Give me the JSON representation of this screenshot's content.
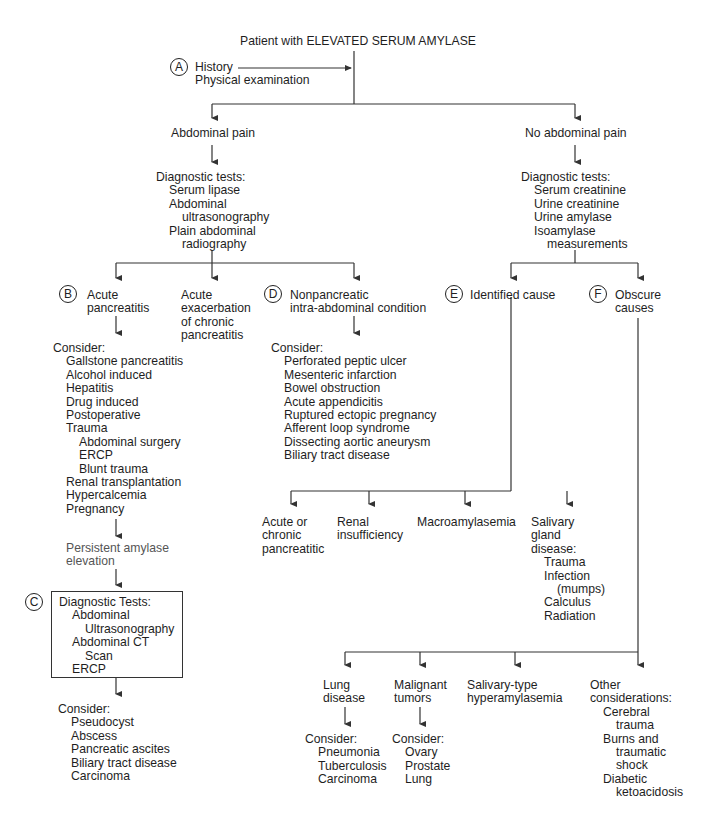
{
  "title": "Patient with ELEVATED SERUM AMYLASE",
  "step_a": {
    "badge": "A",
    "lines": [
      "History",
      "Physical examination"
    ]
  },
  "abdominal_pain": {
    "label": "Abdominal pain",
    "tests_header": "Diagnostic tests:",
    "tests": [
      "Serum lipase",
      "Abdominal",
      "ultrasonography",
      "Plain abdominal",
      "radiography"
    ]
  },
  "no_abdominal_pain": {
    "label": "No abdominal pain",
    "tests_header": "Diagnostic tests:",
    "tests": [
      "Serum creatinine",
      "Urine creatinine",
      "Urine amylase",
      "Isoamylase",
      "measurements"
    ]
  },
  "acute_pancreatitis": {
    "badge": "B",
    "label_lines": [
      "Acute",
      "pancreatitis"
    ],
    "consider_header": "Consider:",
    "consider": [
      "Gallstone pancreatitis",
      "Alcohol induced",
      "Hepatitis",
      "Drug induced",
      "Postoperative",
      "Trauma",
      "Abdominal surgery",
      "ERCP",
      "Blunt trauma",
      "Renal transplantation",
      "Hypercalcemia",
      "Pregnancy"
    ],
    "persistent_lines": [
      "Persistent amylase",
      "elevation"
    ]
  },
  "acute_exacerbation": {
    "label_lines": [
      "Acute",
      "exacerbation",
      "of chronic",
      "pancreatitis"
    ]
  },
  "nonpancreatic": {
    "badge": "D",
    "label_lines": [
      "Nonpancreatic",
      "intra-abdominal condition"
    ],
    "consider_header": "Consider:",
    "consider": [
      "Perforated peptic ulcer",
      "Mesenteric infarction",
      "Bowel obstruction",
      "Acute appendicitis",
      "Ruptured ectopic pregnancy",
      "Afferent loop syndrome",
      "Dissecting aortic aneurysm",
      "Biliary tract disease"
    ]
  },
  "step_c": {
    "badge": "C",
    "tests_header": "Diagnostic Tests:",
    "tests": [
      "Abdominal",
      "Ultrasonography",
      "Abdominal CT",
      "Scan",
      "ERCP"
    ],
    "consider_header": "Consider:",
    "consider": [
      "Pseudocyst",
      "Abscess",
      "Pancreatic ascites",
      "Biliary tract disease",
      "Carcinoma"
    ]
  },
  "identified_cause": {
    "badge": "E",
    "label": "Identified cause",
    "children": [
      {
        "lines": [
          "Acute or",
          "chronic",
          "pancreatitic"
        ]
      },
      {
        "lines": [
          "Renal",
          "insufficiency"
        ]
      },
      {
        "lines": [
          "Macroamylasemia"
        ]
      },
      {
        "lines": [
          "Salivary",
          "gland",
          "disease:"
        ],
        "sub": [
          "Trauma",
          "Infection",
          "(mumps)",
          "Calculus",
          "Radiation"
        ]
      }
    ]
  },
  "obscure_causes": {
    "badge": "F",
    "label_lines": [
      "Obscure",
      "causes"
    ],
    "children": [
      {
        "lines": [
          "Lung",
          "disease"
        ],
        "consider_header": "Consider:",
        "consider": [
          "Pneumonia",
          "Tuberculosis",
          "Carcinoma"
        ]
      },
      {
        "lines": [
          "Malignant",
          "tumors"
        ],
        "consider_header": "Consider:",
        "consider": [
          "Ovary",
          "Prostate",
          "Lung"
        ]
      },
      {
        "lines": [
          "Salivary-type",
          "hyperamylasemia"
        ]
      },
      {
        "lines": [
          "Other",
          "considerations:"
        ],
        "sub": [
          "Cerebral",
          "trauma",
          "Burns and",
          "traumatic",
          "shock",
          "Diabetic",
          "ketoacidosis"
        ]
      }
    ]
  },
  "colors": {
    "line": "#333333",
    "text": "#1e1e1e",
    "background": "#ffffff"
  }
}
